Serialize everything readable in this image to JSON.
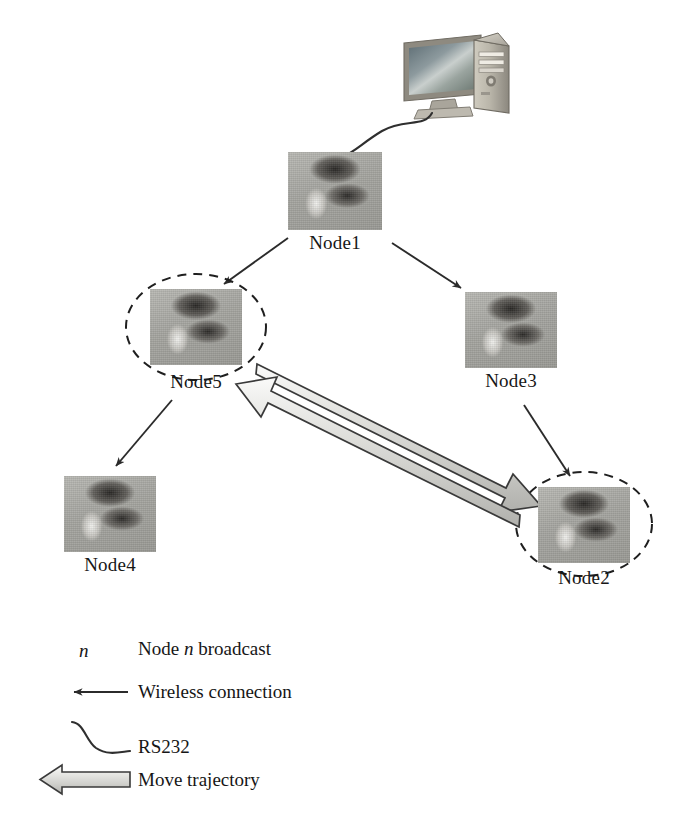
{
  "figure": {
    "type": "network-topology-diagram",
    "background_color": "#ffffff",
    "ink_color": "#1a1a1a"
  },
  "devices": {
    "computer": {
      "name": "desktop-computer",
      "label": ""
    }
  },
  "nodes": [
    {
      "id": "node1",
      "label": "Node1",
      "broadcast": false,
      "x": 288,
      "y": 152,
      "w": 94,
      "h": 78
    },
    {
      "id": "node5",
      "label": "Node5",
      "broadcast": true,
      "x": 150,
      "y": 289,
      "w": 92,
      "h": 76
    },
    {
      "id": "node3",
      "label": "Node3",
      "broadcast": false,
      "x": 465,
      "y": 292,
      "w": 92,
      "h": 76
    },
    {
      "id": "node4",
      "label": "Node4",
      "broadcast": false,
      "x": 64,
      "y": 476,
      "w": 92,
      "h": 76
    },
    {
      "id": "node2",
      "label": "Node2",
      "broadcast": true,
      "x": 538,
      "y": 487,
      "w": 92,
      "h": 76
    }
  ],
  "connections": [
    {
      "from": "computer",
      "to": "node1",
      "kind": "rs232"
    },
    {
      "from": "node1",
      "to": "node5",
      "kind": "wireless"
    },
    {
      "from": "node1",
      "to": "node3",
      "kind": "wireless"
    },
    {
      "from": "node5",
      "to": "node4",
      "kind": "wireless"
    },
    {
      "from": "node3",
      "to": "node2",
      "kind": "wireless"
    },
    {
      "from": "node5",
      "to": "node2",
      "kind": "move-trajectory",
      "bidirectional": true
    }
  ],
  "legend": {
    "items": [
      {
        "symbol": "broadcast-n-symbol",
        "symbol_text": "n",
        "label_prefix": "Node ",
        "label_italic": "n",
        "label_suffix": " broadcast",
        "text": "Node n broadcast"
      },
      {
        "symbol": "wireless-arrow-symbol",
        "text": "Wireless connection"
      },
      {
        "symbol": "rs232-curve-symbol",
        "text": "RS232"
      },
      {
        "symbol": "move-trajectory-arrow-symbol",
        "text": "Move trajectory"
      }
    ]
  },
  "colors": {
    "arrow_stroke": "#2b2b2b",
    "dashed_ellipse": "#1f1f1f",
    "trajectory_fill_light": "#f0f0ee",
    "trajectory_fill_mid": "#d2d2ce",
    "trajectory_fill_dark": "#b4b4b0",
    "trajectory_stroke": "#3a3a3a",
    "photo_base": "#a8a8a4"
  }
}
